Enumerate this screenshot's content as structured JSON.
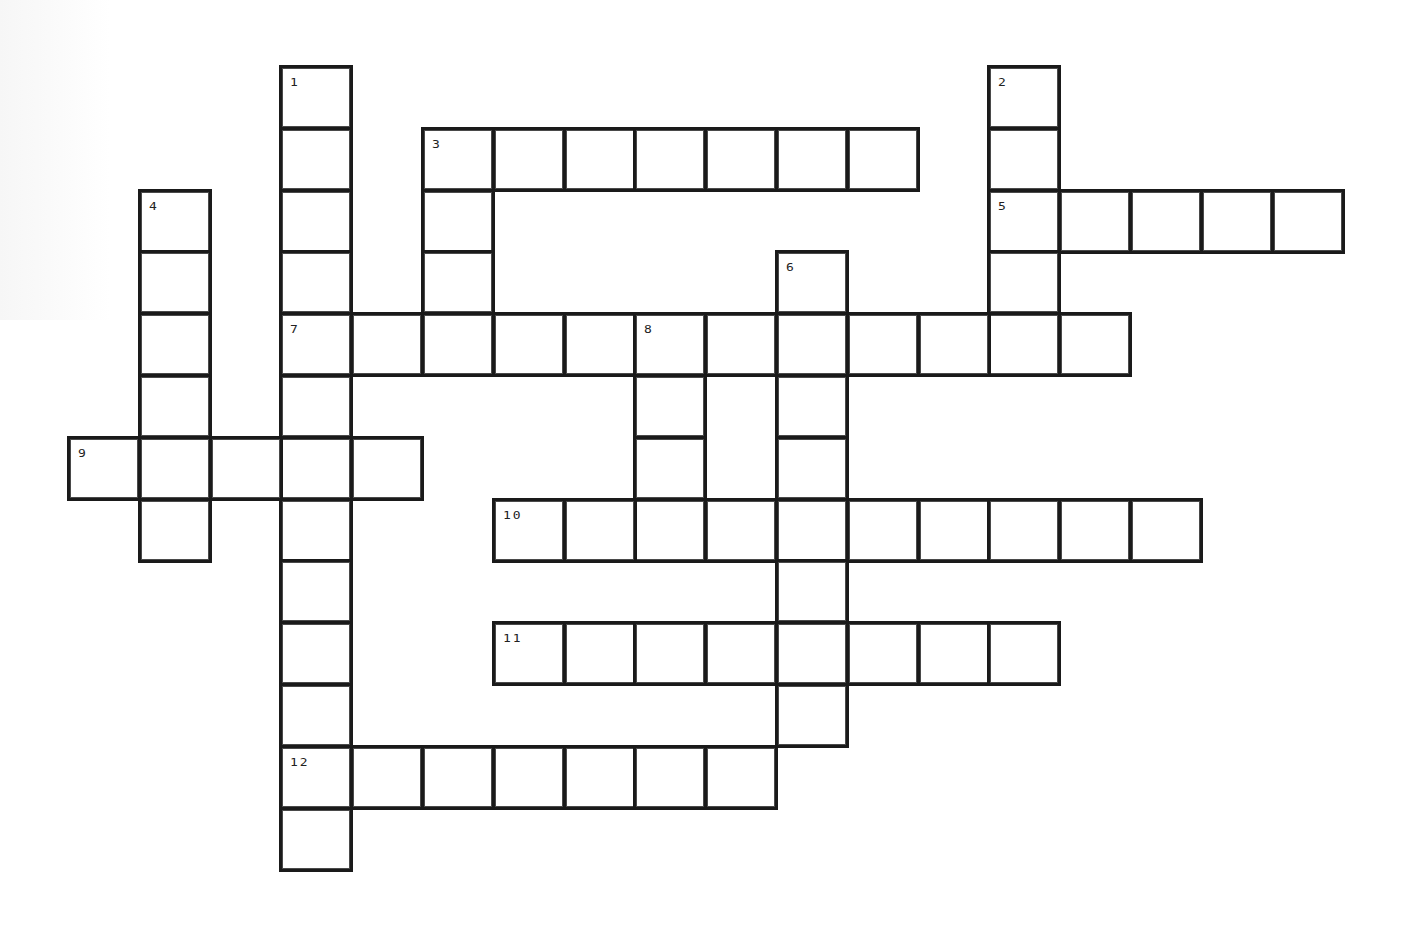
{
  "page": {
    "background": "#ffffff",
    "line_color": "#1a1a1a"
  },
  "grid": {
    "origin_x": 67,
    "origin_y": 65,
    "cell_width": 70.8,
    "cell_height": 61.8
  },
  "words": [
    {
      "number": "1",
      "direction": "down",
      "row": 0,
      "col": 3,
      "length": 13
    },
    {
      "number": "2",
      "direction": "down",
      "row": 0,
      "col": 13,
      "length": 5
    },
    {
      "number": "3",
      "direction": "across",
      "row": 1,
      "col": 5,
      "length": 7
    },
    {
      "number": "3",
      "direction": "down",
      "row": 1,
      "col": 5,
      "length": 4
    },
    {
      "number": "4",
      "direction": "down",
      "row": 2,
      "col": 1,
      "length": 6
    },
    {
      "number": "5",
      "direction": "across",
      "row": 2,
      "col": 13,
      "length": 5
    },
    {
      "number": "6",
      "direction": "down",
      "row": 3,
      "col": 10,
      "length": 8
    },
    {
      "number": "7",
      "direction": "across",
      "row": 4,
      "col": 3,
      "length": 12
    },
    {
      "number": "8",
      "direction": "down",
      "row": 4,
      "col": 8,
      "length": 4
    },
    {
      "number": "9",
      "direction": "across",
      "row": 6,
      "col": 0,
      "length": 5
    },
    {
      "number": "10",
      "direction": "across",
      "row": 7,
      "col": 6,
      "length": 10
    },
    {
      "number": "11",
      "direction": "across",
      "row": 9,
      "col": 6,
      "length": 8
    },
    {
      "number": "12",
      "direction": "across",
      "row": 11,
      "col": 3,
      "length": 7
    }
  ],
  "clue_numbers": [
    "1",
    "2",
    "3",
    "4",
    "5",
    "6",
    "7",
    "8",
    "9",
    "10",
    "11",
    "12"
  ]
}
